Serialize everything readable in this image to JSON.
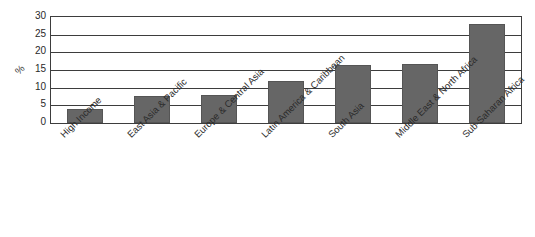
{
  "chart_data": {
    "type": "bar",
    "title": "",
    "subtitle": "",
    "xlabel": "",
    "ylabel": "%",
    "categories": [
      "High Income",
      "East Asia & Pacific",
      "Europe & Central Asia",
      "Latin America & Caribbean",
      "South Asia",
      "Middle East & North Africa",
      "Sub-Saharan Africa"
    ],
    "values": [
      4.0,
      7.5,
      7.8,
      12.0,
      16.4,
      16.7,
      28.0
    ],
    "ylim": [
      0,
      30
    ],
    "yticks": [
      0,
      5,
      10,
      15,
      20,
      25,
      30
    ],
    "ytick_labels": [
      "0",
      "5",
      "10",
      "15",
      "20",
      "25",
      "30"
    ],
    "grid": true,
    "grid_axis": "y",
    "legend": false,
    "legend_position": "none",
    "bar_color": "#666666",
    "bar_edge_color": "#555555",
    "axis_color": "#3d3d3d",
    "background_color": "#ffffff",
    "tick_label_color": "#2a2a2a"
  }
}
